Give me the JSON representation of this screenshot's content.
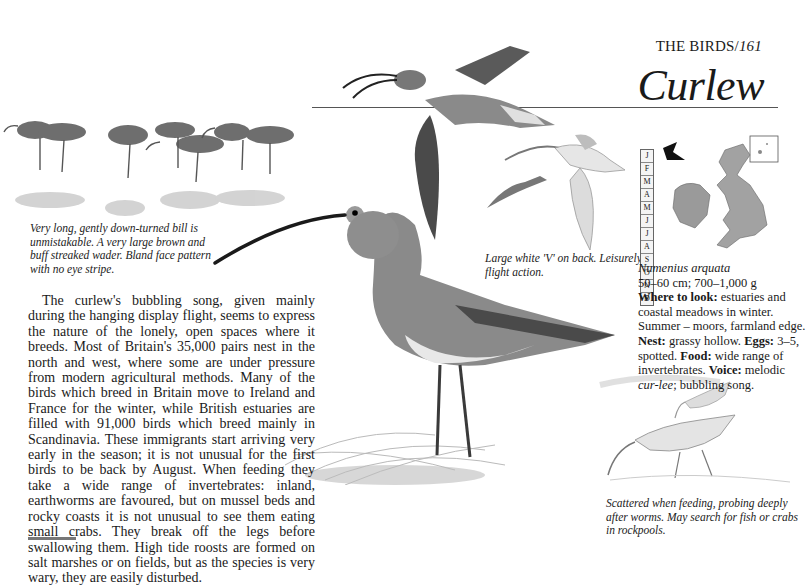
{
  "header": {
    "section": "THE BIRDS/",
    "page_number": "161",
    "title": "Curlew"
  },
  "captions": {
    "identification": "Very long, gently down-turned bill is unmistakable. A very large brown and buff streaked wader. Bland face pattern with no eye stripe.",
    "flight": "Large white 'V' on back. Leisurely flight action.",
    "feeding": "Scattered when feeding, probing deeply after worms. May search for fish or crabs in rockpools."
  },
  "body": {
    "paragraph": "The curlew's bubbling song, given mainly during the hanging display flight, seems to express the nature of the lonely, open spaces where it breeds. Most of Britain's 35,000 pairs nest in the north and west, where some are under pressure from modern agricultural methods. Many of the birds which breed in Britain move to Ireland and France for the winter, while British estuaries are filled with 91,000 birds which breed mainly in Scandinavia. These immigrants start arriving very early in the season; it is not unusual for the first birds to be back by August. When feeding they take a wide range of invertebrates: inland, earthworms are favoured, but on mussel beds and rocky coasts it is not unusual to see them eating small crabs. They break off the legs before swallowing them. High tide roosts are formed on salt marshes or on fields, but as the species is very wary, they are easily disturbed."
  },
  "facts": {
    "scientific_name": "Numenius arquata",
    "size": "50–60 cm; 700–1,000 g",
    "where_label": "Where to look:",
    "where_text": "estuaries and coastal meadows in winter. Summer – moors, farmland edge.",
    "nest_label": "Nest:",
    "nest_text": "grassy hollow.",
    "eggs_label": "Eggs:",
    "eggs_text": "3–5, spotted.",
    "food_label": "Food:",
    "food_text": "wide range of invertebrates.",
    "voice_label": "Voice:",
    "voice_italic": "cur-lee",
    "voice_pre": "melodic",
    "voice_post": "; bubbling song."
  },
  "months": [
    "J",
    "F",
    "M",
    "A",
    "M",
    "J",
    "J",
    "A",
    "S",
    "O",
    "N",
    "D"
  ],
  "colors": {
    "text": "#1a1a1a",
    "rule": "#555555",
    "map_land": "#9a9a9a",
    "bird_dark": "#4a4a4a",
    "bird_mid": "#8a8a8a",
    "bird_light": "#c8c8c8"
  }
}
